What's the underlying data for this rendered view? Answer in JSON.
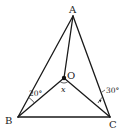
{
  "diagram": {
    "type": "geometry-triangle",
    "points": {
      "A": {
        "label": "A",
        "x": 73,
        "y": 16
      },
      "B": {
        "label": "B",
        "x": 18,
        "y": 117
      },
      "C": {
        "label": "C",
        "x": 110,
        "y": 117
      },
      "O": {
        "label": "O",
        "x": 64,
        "y": 78
      }
    },
    "segments": [
      "AB",
      "AC",
      "BC",
      "AO",
      "BO",
      "CO"
    ],
    "angles": {
      "ABO": {
        "label": "20°"
      },
      "ACO": {
        "label": "30°"
      },
      "BOC": {
        "label": "x"
      }
    },
    "colors": {
      "line": "#1a1a1a",
      "text": "#222222",
      "background": "#ffffff"
    }
  }
}
